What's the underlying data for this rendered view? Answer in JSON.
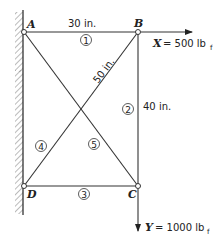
{
  "figure": {
    "nodes": {
      "A": "A",
      "B": "B",
      "C": "C",
      "D": "D"
    },
    "dimensions": {
      "top": "30 in.",
      "diagonal": "50 in.",
      "right": "40 in."
    },
    "members": [
      "1",
      "2",
      "3",
      "4",
      "5"
    ],
    "loads": {
      "x_var": "X",
      "x_value": "= 500 lb",
      "x_sub": "f",
      "y_var": "Y",
      "y_value": "= 1000 lb",
      "y_sub": "f"
    }
  }
}
